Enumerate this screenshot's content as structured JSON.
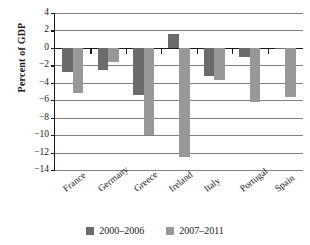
{
  "chart_data": {
    "type": "bar",
    "title": "",
    "xlabel": "",
    "ylabel": "Percent of GDP",
    "categories": [
      "France",
      "Germany",
      "Greece",
      "Ireland",
      "Italy",
      "Portugal",
      "Spain"
    ],
    "series": [
      {
        "name": "2000–2006",
        "color": "#6b6b6b",
        "values": [
          -2.8,
          -2.5,
          -5.4,
          1.6,
          -3.2,
          -1.0,
          -0.1
        ]
      },
      {
        "name": "2007–2011",
        "color": "#989898",
        "values": [
          -5.2,
          -1.6,
          -10.0,
          -12.5,
          -3.7,
          -6.2,
          -5.6
        ]
      }
    ],
    "ylim": [
      -14,
      4
    ],
    "ytick_labels": [
      "4",
      "2",
      "0",
      "−2",
      "−4",
      "−6",
      "−8",
      "−10",
      "−12",
      "−14"
    ],
    "ytick_values": [
      4,
      2,
      0,
      -2,
      -4,
      -6,
      -8,
      -10,
      -12,
      -14
    ],
    "grid": true,
    "legend_position": "bottom"
  },
  "legend": {
    "items": [
      {
        "label": "2000–2006",
        "color": "#6b6b6b"
      },
      {
        "label": "2007–2011",
        "color": "#989898"
      }
    ]
  }
}
